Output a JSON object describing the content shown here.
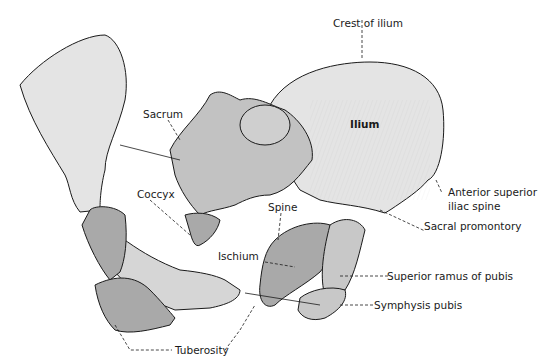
{
  "figure": {
    "colors": {
      "background": "#ffffff",
      "light_bone": "#e4e4e4",
      "dark_bone": "#a9a9a9",
      "mid_bone": "#c8c8c8",
      "outline": "#1a1a1a"
    }
  },
  "labels": {
    "crest_of_ilium": "Crest of ilium",
    "ilium": "Ilium",
    "sacrum": "Sacrum",
    "coccyx": "Coccyx",
    "spine": "Spine",
    "anterior_superior_iliac_spine_1": "Anterior superior",
    "anterior_superior_iliac_spine_2": "iliac spine",
    "sacral_promontory": "Sacral promontory",
    "ischium": "Ischium",
    "superior_ramus_of_pubis": "Superior ramus of pubis",
    "symphysis_pubis": "Symphysis pubis",
    "tuberosity": "Tuberosity"
  }
}
